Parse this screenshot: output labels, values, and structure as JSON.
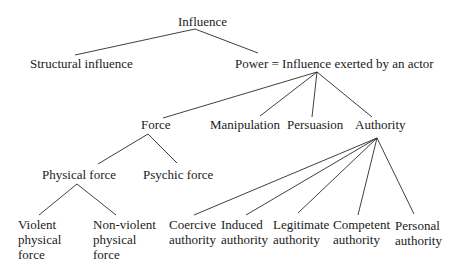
{
  "diagram": {
    "type": "tree",
    "nodes": {
      "influence": {
        "label": "Influence"
      },
      "structural": {
        "label": "Structural influence"
      },
      "power": {
        "label": "Power = Influence exerted by an actor"
      },
      "force": {
        "label": "Force"
      },
      "manipulation": {
        "label": "Manipulation"
      },
      "persuasion": {
        "label": "Persuasion"
      },
      "authority": {
        "label": "Authority"
      },
      "physical_force": {
        "label": "Physical force"
      },
      "psychic_force": {
        "label": "Psychic force"
      },
      "violent": {
        "lines": [
          "Violent",
          "physical",
          "force"
        ]
      },
      "nonviolent": {
        "lines": [
          "Non-violent",
          "physical",
          "force"
        ]
      },
      "coercive": {
        "lines": [
          "Coercive",
          "authority"
        ]
      },
      "induced": {
        "lines": [
          "Induced",
          "authority"
        ]
      },
      "legitimate": {
        "lines": [
          "Legitimate",
          "authority"
        ]
      },
      "competent": {
        "lines": [
          "Competent",
          "authority"
        ]
      },
      "personal": {
        "lines": [
          "Personal",
          "authority"
        ]
      }
    },
    "edges": [
      [
        "influence",
        "structural"
      ],
      [
        "influence",
        "power"
      ],
      [
        "power",
        "force"
      ],
      [
        "power",
        "manipulation"
      ],
      [
        "power",
        "persuasion"
      ],
      [
        "power",
        "authority"
      ],
      [
        "force",
        "physical_force"
      ],
      [
        "force",
        "psychic_force"
      ],
      [
        "physical_force",
        "violent"
      ],
      [
        "physical_force",
        "nonviolent"
      ],
      [
        "authority",
        "coercive"
      ],
      [
        "authority",
        "induced"
      ],
      [
        "authority",
        "legitimate"
      ],
      [
        "authority",
        "competent"
      ],
      [
        "authority",
        "personal"
      ]
    ]
  }
}
